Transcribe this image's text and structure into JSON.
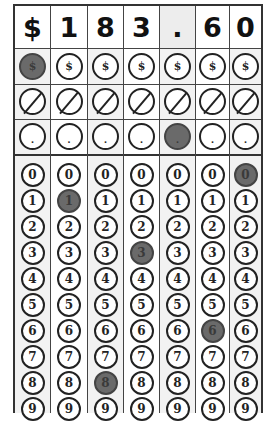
{
  "answer": {
    "display": [
      "$",
      "1",
      "8",
      "3",
      ".",
      "6",
      "0"
    ],
    "value": "$183.60"
  },
  "row_symbols": {
    "dollar": "$",
    "slash": "/",
    "dot": "."
  },
  "digit_labels": [
    "0",
    "1",
    "2",
    "3",
    "4",
    "5",
    "6",
    "7",
    "8",
    "9"
  ],
  "columns": [
    {
      "header": "$",
      "dollar_filled": true,
      "dot_filled": false,
      "digit_filled": null
    },
    {
      "header": "1",
      "dollar_filled": false,
      "dot_filled": false,
      "digit_filled": 1
    },
    {
      "header": "8",
      "dollar_filled": false,
      "dot_filled": false,
      "digit_filled": 8
    },
    {
      "header": "3",
      "dollar_filled": false,
      "dot_filled": false,
      "digit_filled": 3
    },
    {
      "header": ".",
      "dollar_filled": false,
      "dot_filled": true,
      "digit_filled": null
    },
    {
      "header": "6",
      "dollar_filled": false,
      "dot_filled": false,
      "digit_filled": 6
    },
    {
      "header": "0",
      "dollar_filled": false,
      "dot_filled": false,
      "digit_filled": 0
    }
  ],
  "colors": {
    "filled_bubble": "#6a6a6a",
    "border": "#333333",
    "shaded_column": "#f2f2f2"
  }
}
